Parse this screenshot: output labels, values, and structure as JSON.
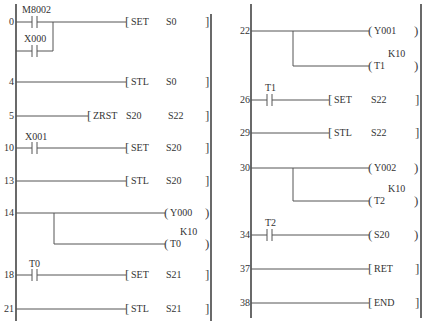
{
  "diagram": {
    "type": "ladder-diagram",
    "left_panel": {
      "rungs": [
        {
          "step": "0",
          "contacts": [
            "M8002",
            "X000"
          ],
          "instruction": "SET",
          "operands": [
            "S0"
          ]
        },
        {
          "step": "4",
          "contacts": [],
          "instruction": "STL",
          "operands": [
            "S0"
          ]
        },
        {
          "step": "5",
          "contacts": [],
          "instruction": "ZRST",
          "operands": [
            "S20",
            "S22"
          ]
        },
        {
          "step": "10",
          "contacts": [
            "X001"
          ],
          "instruction": "SET",
          "operands": [
            "S20"
          ]
        },
        {
          "step": "13",
          "contacts": [],
          "instruction": "STL",
          "operands": [
            "S20"
          ]
        },
        {
          "step": "14",
          "contacts": [],
          "coils": [
            "Y000",
            "T0"
          ],
          "timer_const": "K10"
        },
        {
          "step": "18",
          "contacts": [
            "T0"
          ],
          "instruction": "SET",
          "operands": [
            "S21"
          ]
        },
        {
          "step": "21",
          "contacts": [],
          "instruction": "STL",
          "operands": [
            "S21"
          ]
        }
      ]
    },
    "right_panel": {
      "rungs": [
        {
          "step": "22",
          "contacts": [],
          "coils": [
            "Y001",
            "T1"
          ],
          "timer_const": "K10"
        },
        {
          "step": "26",
          "contacts": [
            "T1"
          ],
          "instruction": "SET",
          "operands": [
            "S22"
          ]
        },
        {
          "step": "29",
          "contacts": [],
          "instruction": "STL",
          "operands": [
            "S22"
          ]
        },
        {
          "step": "30",
          "contacts": [],
          "coils": [
            "Y002",
            "T2"
          ],
          "timer_const": "K10"
        },
        {
          "step": "34",
          "contacts": [
            "T2"
          ],
          "coils": [
            "S20"
          ]
        },
        {
          "step": "37",
          "contacts": [],
          "instruction": "RET",
          "operands": []
        },
        {
          "step": "38",
          "contacts": [],
          "instruction": "END",
          "operands": []
        }
      ]
    }
  },
  "labels": {
    "s0": "0",
    "s4": "4",
    "s5": "5",
    "s10": "10",
    "s13": "13",
    "s14": "14",
    "s18": "18",
    "s21": "21",
    "s22": "22",
    "s26": "26",
    "s29": "29",
    "s30": "30",
    "s34": "34",
    "s37": "37",
    "s38": "38",
    "m8002": "M8002",
    "x000": "X000",
    "x001": "X001",
    "t0c": "T0",
    "t1c": "T1",
    "t2c": "T2",
    "set": "SET",
    "stl": "STL",
    "zrst": "ZRST",
    "ret": "RET",
    "end": "END",
    "S0": "S0",
    "S20": "S20",
    "S21": "S21",
    "S22": "S22",
    "Y000": "Y000",
    "Y001": "Y001",
    "Y002": "Y002",
    "T0": "T0",
    "T1": "T1",
    "T2": "T2",
    "K10": "K10"
  }
}
